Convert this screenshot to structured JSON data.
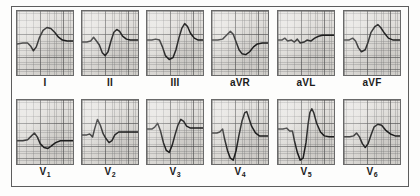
{
  "figure": {
    "colors": {
      "trace": "#1c1c1c",
      "grid_major": "#505050",
      "grid_minor": "#787878",
      "paper": "#ded c d8",
      "frame": "#5d5d5d",
      "label_text": "#1a1a1a"
    },
    "rows": [
      {
        "name": "limb-leads",
        "leads": [
          {
            "id": "I",
            "label": "I",
            "subscript": "",
            "morphology": "low-amplitude rS with broad rounded upright T wave",
            "path": "M0,34 L6,33 L11,33 L14,36 L17,41 L20,37 L23,28 L27,20 L31,17 L35,18 L39,22 L43,27 L47,30 L52,31 L58,31"
          },
          {
            "id": "II",
            "label": "II",
            "subscript": "",
            "morphology": "small r, deep S, tall peaked T wave",
            "path": "M0,32 L5,32 L9,31 L12,27 L15,31 L18,35 L21,43 L24,46 L27,42 L30,31 L33,22 L36,19 L39,21 L42,26 L46,29 L50,30 L54,30 L58,30"
          },
          {
            "id": "III",
            "label": "III",
            "subscript": "",
            "morphology": "deep S wave followed by tall peaked T wave",
            "path": "M0,30 L5,30 L9,29 L13,30 L16,37 L19,46 L23,50 L27,48 L30,40 L33,28 L36,18 L39,13 L42,16 L45,23 L49,28 L53,30 L58,30"
          },
          {
            "id": "aVR",
            "label": "aVR",
            "subscript": "",
            "morphology": "small positive deflection then negative T wave",
            "path": "M0,30 L6,30 L11,29 L15,25 L19,21 L22,24 L25,32 L28,40 L31,44 L35,45 L39,42 L43,37 L47,34 L52,33 L58,33"
          },
          {
            "id": "aVL",
            "label": "aVL",
            "subscript": "",
            "morphology": "very low amplitude, nearly isoelectric complexes",
            "path": "M0,30 L4,30 L7,28 L10,31 L14,30 L17,32 L20,29 L23,33 L27,32 L30,30 L34,31 L38,28 L42,26 L46,25 L50,25 L54,25 L58,25"
          },
          {
            "id": "aVF",
            "label": "aVF",
            "subscript": "",
            "morphology": "small S wave with tall upright T wave",
            "path": "M0,30 L5,30 L9,28 L12,31 L15,38 L18,42 L22,40 L25,32 L28,22 L32,16 L35,14 L38,17 L42,23 L46,28 L51,30 L58,30"
          }
        ]
      },
      {
        "name": "precordial-leads",
        "leads": [
          {
            "id": "V1",
            "label": "V",
            "subscript": "1",
            "morphology": "small rS with shallow inverted T wave",
            "path": "M0,42 L6,42 L11,41 L15,37 L18,34 L21,38 L24,45 L28,49 L32,50 L36,47 L40,44 L45,42 L50,42 L58,42"
          },
          {
            "id": "V2",
            "label": "V",
            "subscript": "2",
            "morphology": "sharp rS complex with biphasic recovery",
            "path": "M0,36 L5,36 L8,35 L11,38 L13,30 L16,20 L19,26 L22,35 L25,40 L28,44 L31,42 L34,36 L38,33 L43,33 L49,33 L58,33"
          },
          {
            "id": "V3",
            "label": "V",
            "subscript": "3",
            "morphology": "deep S wave with tall R and rapid return",
            "path": "M0,30 L5,30 L8,28 L11,24 L14,32 L17,44 L20,52 L23,54 L26,47 L29,36 L32,26 L35,20 L38,22 L41,27 L45,29 L50,29 L58,29"
          },
          {
            "id": "V4",
            "label": "V",
            "subscript": "4",
            "morphology": "very deep S wave with tall R wave and broad T",
            "path": "M0,34 L5,34 L8,33 L11,30 L13,40 L16,52 L19,60 L22,62 L25,52 L28,36 L31,22 L34,13 L36,12 L38,18 L41,27 L45,34 L49,37 L53,37 L58,37"
          },
          {
            "id": "V5",
            "label": "V",
            "subscript": "5",
            "morphology": "very deep S wave with very tall R wave",
            "path": "M0,30 L5,30 L9,29 L12,32 L15,32 L17,42 L20,54 L23,62 L26,60 L29,44 L31,26 L33,13 L35,9 L37,13 L40,24 L44,33 L48,37 L53,38 L58,38"
          },
          {
            "id": "V6",
            "label": "V",
            "subscript": "6",
            "morphology": "small rS with broad rounded upright T wave",
            "path": "M0,38 L6,38 L10,37 L13,34 L16,38 L19,45 L22,49 L25,45 L28,36 L31,28 L35,25 L39,26 L43,31 L48,35 L53,37 L58,37"
          }
        ]
      }
    ]
  }
}
